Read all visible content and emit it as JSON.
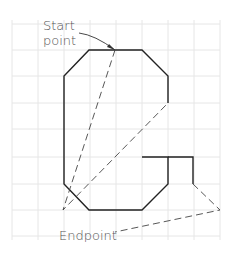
{
  "labels": {
    "start_line1": "Start",
    "start_line2": "point",
    "endpoint": "Endpoint"
  },
  "colors": {
    "background": "#ffffff",
    "grid": "#e6e6e6",
    "outline": "#222222",
    "dashed": "#444444",
    "text": "#555555"
  },
  "grid": {
    "x": [
      12,
      38,
      64,
      90,
      116,
      142,
      168,
      194,
      220
    ],
    "y": [
      24,
      50,
      76,
      103,
      129,
      157,
      184,
      210,
      236
    ]
  },
  "outline_points": "142,157 168,157 168,184 142,210 89,210 64,184 64,76 89,50 142,50 168,76 168,103",
  "hook_points": "168,157 193,157 193,184",
  "dashed_paths": [
    "M115,50 L63,210 L168,103",
    "M193,184 L220,210 L115,232"
  ],
  "leaders": {
    "start": "M79,33 Q95,35 115,50",
    "end": "M114,233 L118,232"
  }
}
